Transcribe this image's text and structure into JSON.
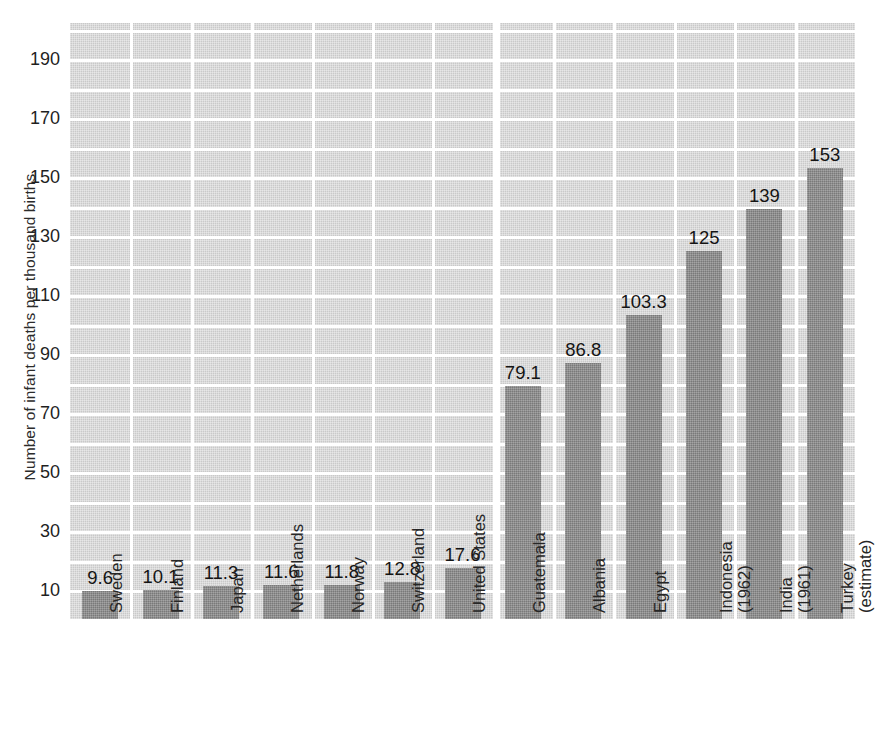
{
  "chart_data": {
    "type": "bar",
    "title": "",
    "xlabel": "",
    "ylabel": "Number of infant deaths per thousand births",
    "ylim": [
      0,
      200
    ],
    "ytick_labels": [
      "10",
      "30",
      "50",
      "70",
      "90",
      "110",
      "130",
      "150",
      "170",
      "190"
    ],
    "ytick_values": [
      10,
      30,
      50,
      70,
      90,
      110,
      130,
      150,
      170,
      190
    ],
    "grid": true,
    "legend": "none",
    "orientation": "vertical",
    "categories": [
      "Sweden",
      "Finland",
      "Japan",
      "Netherlands",
      "Norway",
      "Switzerland",
      "United States",
      "Guatemala",
      "Albania",
      "Egypt",
      "Indonesia (1962)",
      "India (1961)",
      "Turkey (estimate)"
    ],
    "category_lines": [
      [
        "Sweden"
      ],
      [
        "Finland"
      ],
      [
        "Japan"
      ],
      [
        "Netherlands"
      ],
      [
        "Norway"
      ],
      [
        "Switzerland"
      ],
      [
        "United States"
      ],
      [
        "Guatemala"
      ],
      [
        "Albania"
      ],
      [
        "Egypt"
      ],
      [
        "Indonesia",
        "(1962)"
      ],
      [
        "India",
        "(1961)"
      ],
      [
        "Turkey",
        "(estimate)"
      ]
    ],
    "values": [
      9.6,
      10.1,
      11.3,
      11.6,
      11.8,
      12.8,
      17.6,
      79.1,
      86.8,
      103.3,
      125,
      139,
      153
    ],
    "value_labels": [
      "9.6",
      "10.1",
      "11.3",
      "11.6",
      "11.8",
      "12.8",
      "17.6",
      "79.1",
      "86.8",
      "103.3",
      "125",
      "139",
      "153"
    ]
  },
  "colors": {
    "bar": "#878787",
    "plot_background": "#c9c9c9",
    "gridline": "#ffffff",
    "text": "#1f1f1f",
    "page_background": "#ffffff"
  }
}
